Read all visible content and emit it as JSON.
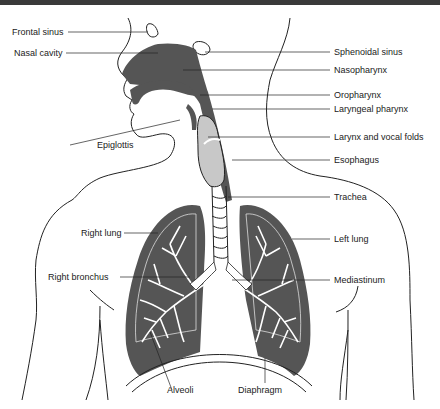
{
  "diagram": {
    "colors": {
      "airway_fill": "#555555",
      "larynx_fill": "#c8c8c8",
      "outline": "#222222",
      "label_text": "#222222",
      "top_bar": "#3a3a3a",
      "background": "#ffffff"
    },
    "labels": {
      "frontal_sinus": "Frontal sinus",
      "nasal_cavity": "Nasal cavity",
      "sphenoidal_sinus": "Sphenoidal sinus",
      "nasopharynx": "Nasopharynx",
      "oropharynx": "Oropharynx",
      "laryngeal_pharynx": "Laryngeal pharynx",
      "epiglottis": "Epiglottis",
      "larynx_vocal_folds": "Larynx and vocal folds",
      "esophagus": "Esophagus",
      "trachea": "Trachea",
      "right_lung": "Right lung",
      "left_lung": "Left lung",
      "right_bronchus": "Right bronchus",
      "mediastinum": "Mediastinum",
      "alveoli": "Alveoli",
      "diaphragm": "Diaphragm"
    }
  }
}
